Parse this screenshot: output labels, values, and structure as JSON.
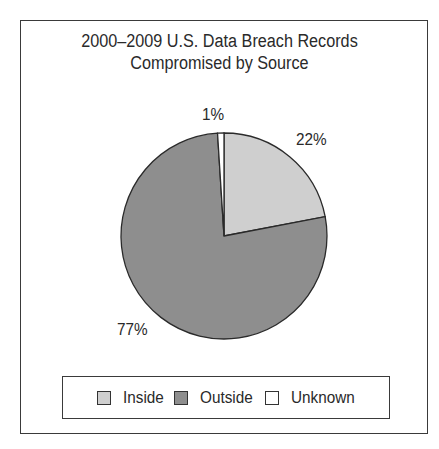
{
  "chart_data": {
    "type": "pie",
    "title": "2000–2009 U.S. Data Breach Records Compromised by Source",
    "title_lines": [
      "2000–2009 U.S. Data Breach Records",
      "Compromised by Source"
    ],
    "categories": [
      "Inside",
      "Outside",
      "Unknown"
    ],
    "values": [
      22,
      77,
      1
    ],
    "value_labels": [
      "22%",
      "77%",
      "1%"
    ],
    "colors": [
      "#cfcfcf",
      "#8e8e8e",
      "#ffffff"
    ],
    "legend_position": "bottom",
    "start_angle_deg": 0,
    "direction": "clockwise"
  },
  "legend": {
    "items": [
      {
        "label": "Inside",
        "color": "#cfcfcf"
      },
      {
        "label": "Outside",
        "color": "#8e8e8e"
      },
      {
        "label": "Unknown",
        "color": "#ffffff"
      }
    ]
  }
}
